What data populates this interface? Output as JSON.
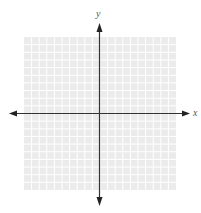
{
  "chart_data": {
    "type": "coordinate-plane",
    "title": "",
    "xlabel": "x",
    "ylabel": "y",
    "grid": true,
    "grid_cells_x": 20,
    "grid_cells_y": 20,
    "xlim": [
      -10,
      10
    ],
    "ylim": [
      -10,
      10
    ],
    "tick_labels": [],
    "series": []
  },
  "labels": {
    "x_axis": "x",
    "y_axis": "y"
  },
  "colors": {
    "grid_background": "#ececec",
    "grid_line": "#ffffff",
    "axis": "#333333"
  }
}
